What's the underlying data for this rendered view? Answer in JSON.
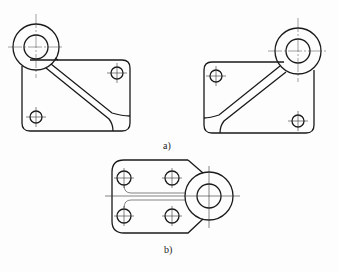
{
  "figure": {
    "labels": {
      "a": "a)",
      "b": "b)"
    },
    "colors": {
      "line": "#1a1a1a",
      "background": "#fdfdfd"
    },
    "parts": [
      {
        "id": "a-left",
        "description": "Rectangular plate with boss at top-left, diagonal rib to bottom-right, two small holes"
      },
      {
        "id": "a-right",
        "description": "Mirrored plate with boss at top-right, diagonal rib to bottom-left, two small holes"
      },
      {
        "id": "b",
        "description": "Plate with four holes, two horizontal ribs, boss at right"
      }
    ]
  }
}
